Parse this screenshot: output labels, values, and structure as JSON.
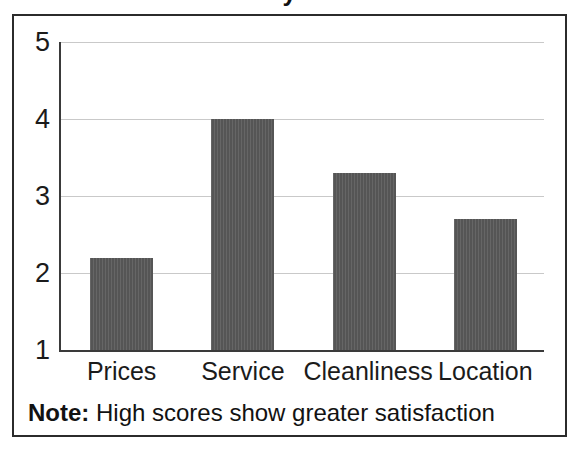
{
  "figure": {
    "title_fragment": "y",
    "note_label": "Note:",
    "note_text": " High scores show greater satisfaction"
  },
  "chart_data": {
    "type": "bar",
    "title": "",
    "xlabel": "",
    "ylabel": "",
    "categories": [
      "Prices",
      "Service",
      "Cleanliness",
      "Location"
    ],
    "values": [
      2.2,
      4.0,
      3.3,
      2.7
    ],
    "ylim": [
      1,
      5
    ],
    "yticks": [
      1,
      2,
      3,
      4,
      5
    ],
    "ytick_labels": [
      "1",
      "2",
      "3",
      "4",
      "5"
    ],
    "grid": true,
    "legend": "none",
    "bar_color": "#555555",
    "gridline_color": "#c9c9c9",
    "axis_color": "#3a3a3a",
    "annotation": "Note: High scores show greater satisfaction"
  }
}
